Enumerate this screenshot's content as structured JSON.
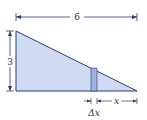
{
  "diagram": {
    "width_label": "6",
    "height_label": "3",
    "x_label": "x",
    "dx_label": "Δx",
    "colors": {
      "fill": "#cfdaf3",
      "stroke": "#2c3b6e",
      "strip": "#9fb3e3",
      "dim": "#2c3b6e"
    }
  }
}
